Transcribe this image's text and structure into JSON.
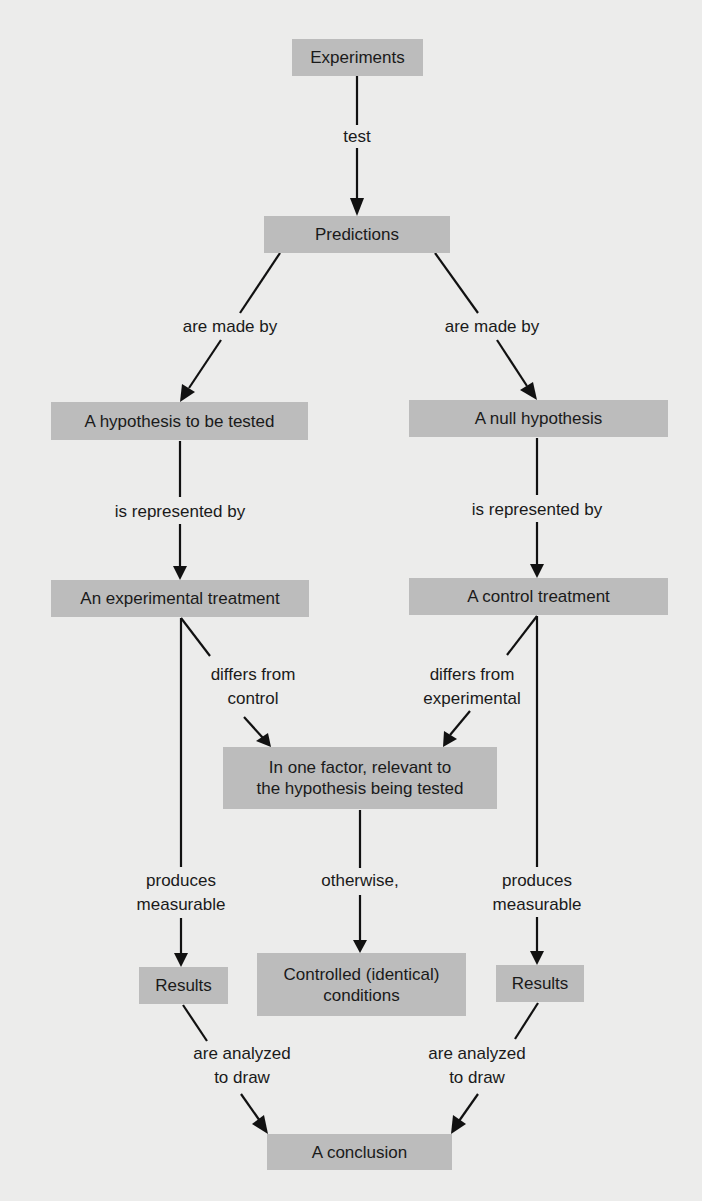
{
  "diagram": {
    "colors": {
      "background": "#ececeb",
      "node_fill": "#bcbcbc",
      "text": "#1a1a1a",
      "line": "#111111"
    },
    "nodes": {
      "experiments": "Experiments",
      "predictions": "Predictions",
      "hypothesis": "A hypothesis to be tested",
      "null_hypothesis": "A null hypothesis",
      "experimental_treatment": "An experimental treatment",
      "control_treatment": "A control treatment",
      "one_factor_line1": "In one factor, relevant to",
      "one_factor_line2": "the hypothesis being tested",
      "results_left": "Results",
      "controlled_line1": "Controlled (identical)",
      "controlled_line2": "conditions",
      "results_right": "Results",
      "conclusion": "A conclusion"
    },
    "edge_labels": {
      "test": "test",
      "made_by_left": "are made by",
      "made_by_right": "are made by",
      "represented_left": "is represented by",
      "represented_right": "is represented by",
      "differs_control_1": "differs from",
      "differs_control_2": "control",
      "differs_exp_1": "differs from",
      "differs_exp_2": "experimental",
      "produces_left_1": "produces",
      "produces_left_2": "measurable",
      "otherwise": "otherwise,",
      "produces_right_1": "produces",
      "produces_right_2": "measurable",
      "analyzed_left_1": "are analyzed",
      "analyzed_left_2": "to draw",
      "analyzed_right_1": "are analyzed",
      "analyzed_right_2": "to draw"
    }
  }
}
